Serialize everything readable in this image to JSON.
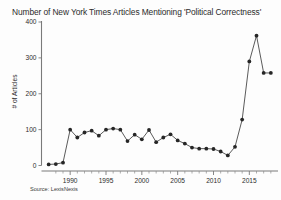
{
  "chart_data": {
    "type": "line",
    "title": "Number of New York Times Articles Mentioning 'Political Correctness'",
    "xlabel": "",
    "ylabel": "# of Articles",
    "source": "Source: LexisNexis",
    "xlim": [
      1986,
      2019
    ],
    "ylim": [
      0,
      400
    ],
    "ytick_values": [
      0,
      100,
      200,
      300,
      400
    ],
    "ytick_labels": [
      "0",
      "100",
      "200",
      "300",
      "400"
    ],
    "xtick_values": [
      1990,
      1995,
      2000,
      2005,
      2010,
      2015
    ],
    "xtick_labels": [
      "1990",
      "1995",
      "2000",
      "2005",
      "2010",
      "2015"
    ],
    "grid": false,
    "legend": false,
    "marker": "filled-circle",
    "line_color": "#3d3d3d",
    "marker_color": "#262626",
    "x": [
      1987,
      1988,
      1989,
      1990,
      1991,
      1992,
      1993,
      1994,
      1995,
      1996,
      1997,
      1998,
      1999,
      2000,
      2001,
      2002,
      2003,
      2004,
      2005,
      2006,
      2007,
      2008,
      2009,
      2010,
      2011,
      2012,
      2013,
      2014,
      2015,
      2016,
      2017,
      2018
    ],
    "values": [
      3,
      4,
      8,
      100,
      78,
      92,
      97,
      83,
      100,
      103,
      100,
      68,
      86,
      73,
      99,
      65,
      78,
      87,
      70,
      61,
      50,
      47,
      47,
      46,
      39,
      28,
      52,
      128,
      290,
      362,
      258,
      258
    ],
    "series": [
      {
        "name": "# of Articles",
        "values": [
          3,
          4,
          8,
          100,
          78,
          92,
          97,
          83,
          100,
          103,
          100,
          68,
          86,
          73,
          99,
          65,
          78,
          87,
          70,
          61,
          50,
          47,
          47,
          46,
          39,
          28,
          52,
          128,
          290,
          362,
          258,
          258
        ]
      }
    ]
  }
}
